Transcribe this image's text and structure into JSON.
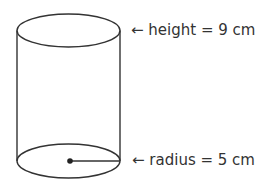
{
  "diagram": {
    "type": "cylinder",
    "stroke_color": "#333333",
    "labels": {
      "height": "← height = 9 cm",
      "radius": "← radius = 5 cm"
    },
    "dimensions": {
      "height": {
        "name": "height",
        "value": 9,
        "unit": "cm"
      },
      "radius": {
        "name": "radius",
        "value": 5,
        "unit": "cm"
      }
    }
  }
}
